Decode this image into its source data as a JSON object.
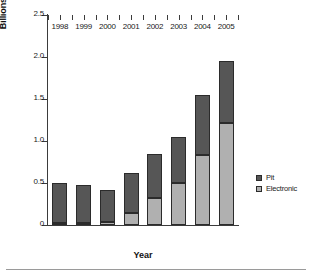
{
  "chart_data": {
    "type": "bar",
    "title": "",
    "xlabel": "Year",
    "ylabel": "Billions of contracts",
    "categories": [
      "1998",
      "1999",
      "2000",
      "2001",
      "2002",
      "2003",
      "2004",
      "2005"
    ],
    "series": [
      {
        "name": "Electronic",
        "color": "#b0b0b0",
        "values": [
          0.02,
          0.02,
          0.04,
          0.14,
          0.32,
          0.5,
          0.83,
          1.21
        ]
      },
      {
        "name": "Pit",
        "color": "#565656",
        "values": [
          0.48,
          0.46,
          0.38,
          0.48,
          0.53,
          0.55,
          0.72,
          0.74
        ]
      }
    ],
    "totals": [
      0.5,
      0.48,
      0.42,
      0.62,
      0.85,
      1.05,
      1.55,
      1.95
    ],
    "stacked": true,
    "ylim": [
      0,
      2.5
    ],
    "yticks": [
      "0",
      "0.5",
      "1.0",
      "1.5",
      "2.0",
      "2.5"
    ],
    "ytick_values": [
      0,
      0.5,
      1.0,
      1.5,
      2.0,
      2.5
    ],
    "grid": false,
    "legend_position": "right"
  },
  "legend": {
    "entries": [
      {
        "label": "Pit",
        "color": "#565656"
      },
      {
        "label": "Electronic",
        "color": "#b0b0b0"
      }
    ]
  }
}
